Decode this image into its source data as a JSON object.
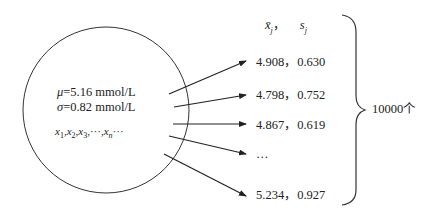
{
  "population": {
    "mu_symbol": "μ",
    "mu_value": "=5.16 mmol/L",
    "sigma_symbol": "σ",
    "sigma_value": "=0.82 mmol/L",
    "sample_seq": [
      "x",
      "1",
      ",",
      "x",
      "2",
      ",",
      "x",
      "3",
      ",···,",
      "x",
      "n",
      "···"
    ]
  },
  "header": {
    "mean_symbol": "x̄",
    "mean_sub": "j",
    "sep": "，",
    "sd_symbol": "s",
    "sd_sub": "j"
  },
  "samples": [
    {
      "label": "4.908，0.630"
    },
    {
      "label": "4.798，0.752"
    },
    {
      "label": "4.867，0.619"
    },
    {
      "label": "…"
    },
    {
      "label": "5.234，0.927"
    }
  ],
  "brace_label": "10000个"
}
